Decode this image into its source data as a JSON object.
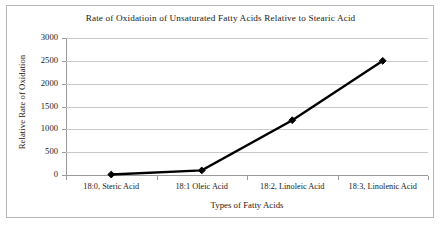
{
  "chart_data": {
    "type": "line",
    "title": "Rate of  Oxidatioin of Unsaturated Fatty Acids Relative to Stearic Acid",
    "xlabel": "Types of Fatty Acids",
    "ylabel": "Relative Rate of Oxidation",
    "categories": [
      "18:0, Steric Acid",
      "18:1 Oleic Acid",
      "18:2, Linoleic Acid",
      "18:3, Linolenic Acid"
    ],
    "values": [
      10,
      100,
      1200,
      2500
    ],
    "series": [
      {
        "name": "Relative Rate of Oxidation",
        "values": [
          10,
          100,
          1200,
          2500
        ]
      }
    ],
    "ylim": [
      0,
      3000
    ],
    "y_ticks": [
      0,
      500,
      1000,
      1500,
      2000,
      2500,
      3000
    ],
    "y_tick_labels": [
      "0",
      "500",
      "1000",
      "1500",
      "2000",
      "2500",
      "3000"
    ],
    "grid": true,
    "legend": false,
    "marker": "diamond",
    "line_color": "#000000",
    "marker_color": "#000000",
    "grid_color": "#c9c9c9",
    "axis_color": "#9a9a9a",
    "plot_background": "#ffffff"
  }
}
